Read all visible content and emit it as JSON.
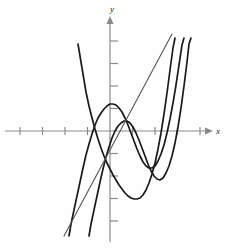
{
  "figure": {
    "title": "",
    "background_color": "#fefefe"
  },
  "axes": {
    "x_label": "x",
    "y_label": "y",
    "x_axis_color": "#8a8a8a",
    "y_axis_color": "#8a8a8a",
    "tick_color": "#8a8a8a",
    "origin_px": [
      110,
      131
    ],
    "unit_px": 22.5,
    "x_ticks": [
      -4,
      -3,
      -2,
      -1,
      1,
      2,
      3,
      4
    ],
    "y_ticks": [
      -4,
      -3,
      -2,
      -1,
      1,
      2,
      3,
      4
    ],
    "x_tick_labels": [
      "",
      "",
      "",
      "",
      "",
      "",
      "",
      ""
    ],
    "y_tick_labels": [
      "",
      "",
      "",
      "",
      "",
      "",
      "",
      ""
    ],
    "x_range_px": [
      5,
      210
    ],
    "y_range_px": [
      18,
      242
    ],
    "arrow_x": true,
    "arrow_y": true,
    "grid": false
  },
  "chart_data": {
    "type": "line",
    "title": "",
    "xlabel": "x",
    "ylabel": "y",
    "xlim": [
      -4.7,
      4.5
    ],
    "ylim": [
      -5.0,
      5.0
    ],
    "grid": false,
    "legend": "none",
    "series": [
      {
        "name": "cubic-curve-left",
        "color": "#1a1a1a",
        "width": 1.7,
        "kind": "cubic",
        "note": "decreasing-then-increasing cubic shifted left, local max near x=-0.5, local min near x=0.9",
        "points_px": [
          [
            69,
            236
          ],
          [
            71,
            224
          ],
          [
            74,
            210
          ],
          [
            77,
            196
          ],
          [
            80,
            182
          ],
          [
            83,
            168
          ],
          [
            86,
            155
          ],
          [
            89,
            144
          ],
          [
            92,
            134
          ],
          [
            95,
            125
          ],
          [
            98,
            118
          ],
          [
            101,
            113
          ],
          [
            104,
            109
          ],
          [
            107,
            106
          ],
          [
            110,
            104
          ],
          [
            113,
            104
          ],
          [
            116,
            105
          ],
          [
            119,
            108
          ],
          [
            122,
            112
          ],
          [
            125,
            118
          ],
          [
            128,
            125
          ],
          [
            131,
            133
          ],
          [
            134,
            141
          ],
          [
            137,
            149
          ],
          [
            140,
            156
          ],
          [
            143,
            162
          ],
          [
            146,
            166
          ],
          [
            149,
            168
          ],
          [
            152,
            168
          ],
          [
            155,
            166
          ],
          [
            158,
            161
          ],
          [
            161,
            154
          ],
          [
            164,
            145
          ],
          [
            167,
            133
          ],
          [
            170,
            119
          ],
          [
            173,
            103
          ],
          [
            176,
            85
          ],
          [
            179,
            65
          ],
          [
            182,
            45
          ],
          [
            184,
            38
          ]
        ]
      },
      {
        "name": "cubic-curve-right",
        "color": "#1a1a1a",
        "width": 1.7,
        "kind": "cubic",
        "note": "same cubic shifted right by about 0.9 unit",
        "points_px": [
          [
            89,
            236
          ],
          [
            91,
            224
          ],
          [
            94,
            210
          ],
          [
            97,
            196
          ],
          [
            100,
            182
          ],
          [
            103,
            169
          ],
          [
            106,
            157
          ],
          [
            109,
            147
          ],
          [
            112,
            138
          ],
          [
            115,
            131
          ],
          [
            118,
            126
          ],
          [
            121,
            123
          ],
          [
            124,
            121
          ],
          [
            127,
            121
          ],
          [
            130,
            123
          ],
          [
            133,
            127
          ],
          [
            136,
            133
          ],
          [
            139,
            140
          ],
          [
            142,
            148
          ],
          [
            145,
            156
          ],
          [
            148,
            164
          ],
          [
            151,
            171
          ],
          [
            154,
            176
          ],
          [
            157,
            179
          ],
          [
            160,
            180
          ],
          [
            163,
            178
          ],
          [
            166,
            173
          ],
          [
            169,
            166
          ],
          [
            172,
            156
          ],
          [
            175,
            143
          ],
          [
            178,
            127
          ],
          [
            181,
            108
          ],
          [
            184,
            86
          ],
          [
            187,
            62
          ],
          [
            189,
            44
          ],
          [
            191,
            38
          ]
        ]
      },
      {
        "name": "steep-falling-cubic",
        "color": "#1a1a1a",
        "width": 1.7,
        "kind": "cubic",
        "note": "steeply descending branch crossing from upper-left to lower-right, bottoms near x=1.6 then rises",
        "points_px": [
          [
            78,
            44
          ],
          [
            80,
            56
          ],
          [
            82,
            68
          ],
          [
            84,
            80
          ],
          [
            86,
            92
          ],
          [
            89,
            106
          ],
          [
            92,
            118
          ],
          [
            95,
            129
          ],
          [
            98,
            139
          ],
          [
            101,
            148
          ],
          [
            104,
            156
          ],
          [
            107,
            163
          ],
          [
            110,
            169
          ],
          [
            113,
            175
          ],
          [
            116,
            180
          ],
          [
            119,
            185
          ],
          [
            122,
            189
          ],
          [
            125,
            193
          ],
          [
            128,
            196
          ],
          [
            131,
            198
          ],
          [
            134,
            199
          ],
          [
            137,
            199
          ],
          [
            140,
            198
          ],
          [
            143,
            195
          ],
          [
            146,
            190
          ],
          [
            149,
            183
          ],
          [
            152,
            174
          ],
          [
            155,
            163
          ],
          [
            158,
            149
          ],
          [
            161,
            133
          ],
          [
            164,
            114
          ],
          [
            167,
            93
          ],
          [
            170,
            70
          ],
          [
            173,
            48
          ],
          [
            175,
            38
          ]
        ]
      },
      {
        "name": "straight-line",
        "color": "#555555",
        "width": 1.1,
        "kind": "line",
        "note": "rising straight line through roughly (-0.7,-4.2) to (2.9,4.5)",
        "points_px": [
          [
            64,
            236
          ],
          [
            172,
            34
          ]
        ]
      }
    ]
  },
  "curve_styles": {
    "curve_color": "#1a1a1a",
    "line_color": "#555555",
    "curve_stroke_width": 1.7,
    "line_stroke_width": 1.1
  }
}
